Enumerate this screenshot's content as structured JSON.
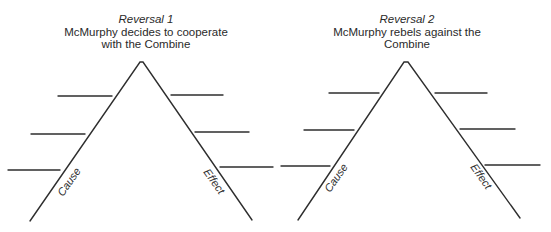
{
  "diagrams": [
    {
      "id": "reversal-1",
      "reversal_label": "Reversal 1",
      "description": "McMurphy decides to cooperate with the Combine",
      "description_lines": [
        "McMurphy decides to cooperate",
        "with the Combine"
      ],
      "left_leg_label": "Cause",
      "right_leg_label": "Effect",
      "cause_lines_count": 3,
      "effect_lines_count": 3
    },
    {
      "id": "reversal-2",
      "reversal_label": "Reversal 2",
      "description": "McMurphy rebels against the Combine",
      "description_lines": [
        "McMurphy rebels against the",
        "Combine"
      ],
      "left_leg_label": "Cause",
      "right_leg_label": "Effect",
      "cause_lines_count": 3,
      "effect_lines_count": 3
    }
  ],
  "colors": {
    "line": "#2e2e2e",
    "text": "#2a2a2a",
    "background": "#ffffff"
  }
}
